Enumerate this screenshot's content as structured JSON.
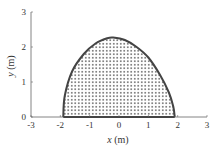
{
  "chart_data": {
    "type": "area",
    "title": "",
    "xlabel": "x (m)",
    "ylabel": "y (m)",
    "xlim": [
      -3,
      3
    ],
    "ylim": [
      0,
      3
    ],
    "xticks": [
      "-3",
      "-2",
      "-1",
      "0",
      "1",
      "2",
      "3"
    ],
    "yticks": [
      "0",
      "1",
      "2",
      "3"
    ],
    "grid": false,
    "legend": null,
    "fill": "dotted",
    "series": [
      {
        "name": "boundary",
        "x": [
          -1.9,
          -1.85,
          -1.6,
          -1.2,
          -0.8,
          -0.4,
          -0.2,
          0.2,
          0.6,
          1.0,
          1.4,
          1.7,
          1.85,
          1.9
        ],
        "y": [
          0,
          0.6,
          1.3,
          1.8,
          2.1,
          2.25,
          2.27,
          2.2,
          2.0,
          1.7,
          1.2,
          0.7,
          0.3,
          0
        ]
      }
    ]
  },
  "axes": {
    "x_label_italic": "x",
    "x_label_unit": " (m)",
    "y_label_italic": "y",
    "y_label_unit": " (m)"
  }
}
